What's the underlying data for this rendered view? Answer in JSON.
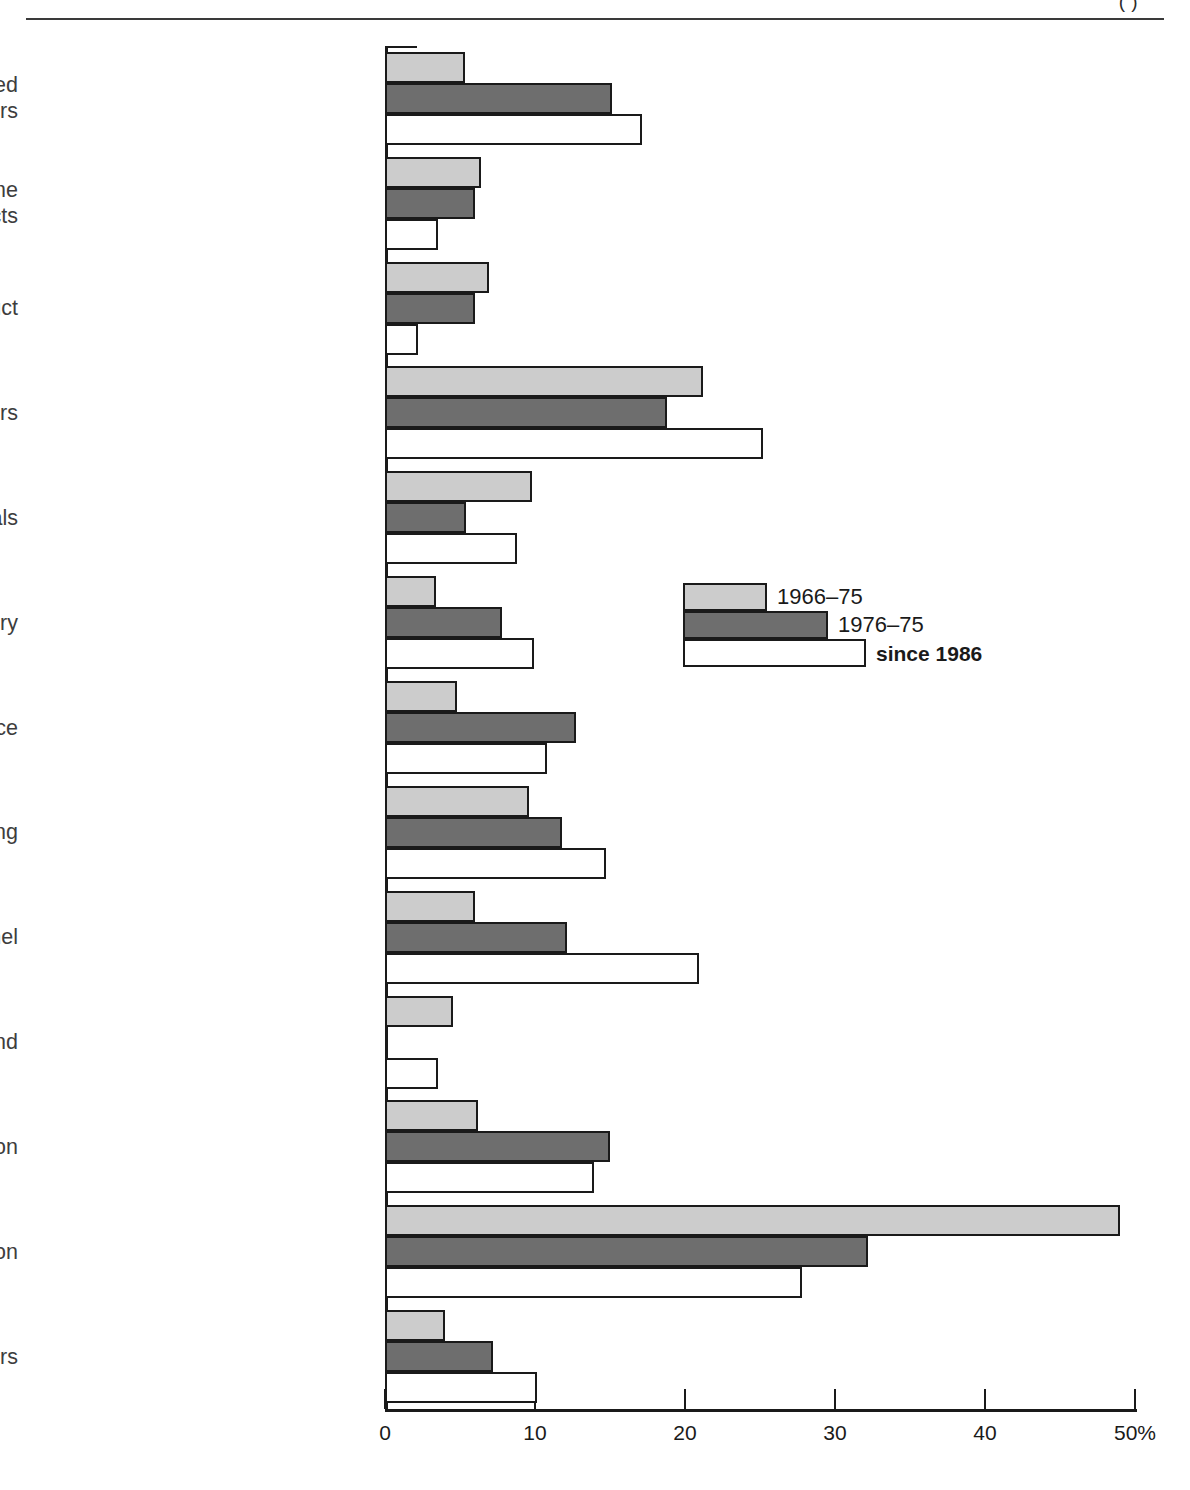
{
  "page": {
    "header_fragment": "(          )"
  },
  "chart_data": {
    "type": "bar",
    "orientation": "horizontal",
    "title": "",
    "xlabel": "",
    "ylabel": "",
    "xlim": [
      0,
      50
    ],
    "grid": false,
    "axis_unit": "%",
    "legend_position": "middle-right",
    "tick_labels": [
      "0",
      "10",
      "20",
      "30",
      "40",
      "50%"
    ],
    "tick_values": [
      0,
      10,
      20,
      30,
      40,
      50
    ],
    "categories": [
      "Received some preferred\ncustomers",
      "Purchased some\nof firm's products",
      "Purchased firm's product",
      "Received subcontracting orders",
      "Able to purchase parts and materials",
      "Able to purchase machinery",
      "Received technological assistance",
      "Received financing",
      "Loaned personnel",
      "Allowed to use brand",
      "Competitive relation",
      "Absolutely no relation",
      "Others"
    ],
    "series": [
      {
        "name": "1966–75",
        "color": "#cccccc",
        "values": [
          5.3,
          6.4,
          6.9,
          21.2,
          9.8,
          3.4,
          4.8,
          9.6,
          6.0,
          4.5,
          6.2,
          49.0,
          4.0
        ]
      },
      {
        "name": "1976–75",
        "color": "#6e6e6e",
        "values": [
          15.1,
          6.0,
          6.0,
          18.8,
          5.4,
          7.8,
          12.7,
          11.8,
          12.1,
          0.0,
          15.0,
          32.2,
          7.2
        ]
      },
      {
        "name": "since 1986",
        "color": "#ffffff",
        "values": [
          17.1,
          3.5,
          2.2,
          25.2,
          8.8,
          9.9,
          10.8,
          14.7,
          20.9,
          3.5,
          13.9,
          27.8,
          10.1
        ]
      }
    ]
  }
}
